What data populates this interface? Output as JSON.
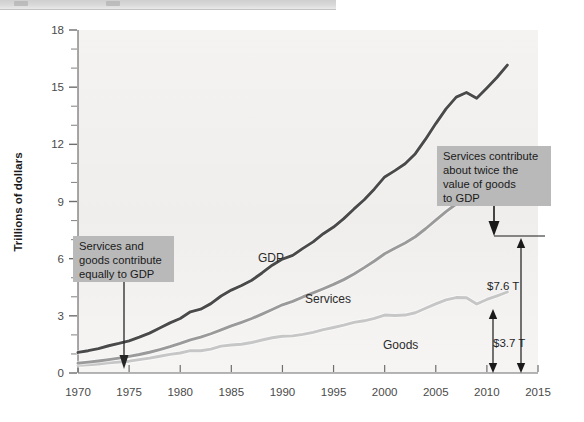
{
  "chrome": {
    "present": true
  },
  "chart_data": {
    "type": "line",
    "title": "",
    "xlabel": "",
    "ylabel": "Trillions of dollars",
    "xlim": [
      1970,
      2015
    ],
    "ylim": [
      0,
      18
    ],
    "xticks": [
      1970,
      1975,
      1980,
      1985,
      1990,
      1995,
      2000,
      2005,
      2010,
      2015
    ],
    "yticks": [
      0,
      3,
      6,
      9,
      12,
      15,
      18
    ],
    "y_minor_step": 1,
    "grid": false,
    "legend": "inline-series-labels",
    "colors": {
      "gdp": "#4a4a4a",
      "services": "#9a9a9a",
      "goods": "#c6c6c6",
      "plot_background": "#f2f1ef",
      "callout_background": "#b9b9b9",
      "axis": "#6e6e6e"
    },
    "x": [
      1970,
      1971,
      1972,
      1973,
      1974,
      1975,
      1976,
      1977,
      1978,
      1979,
      1980,
      1981,
      1982,
      1983,
      1984,
      1985,
      1986,
      1987,
      1988,
      1989,
      1990,
      1991,
      1992,
      1993,
      1994,
      1995,
      1996,
      1997,
      1998,
      1999,
      2000,
      2001,
      2002,
      2003,
      2004,
      2005,
      2006,
      2007,
      2008,
      2009,
      2010,
      2011,
      2012
    ],
    "series": [
      {
        "name": "GDP",
        "label": "GDP",
        "color": "#4a4a4a",
        "values": [
          1.08,
          1.17,
          1.28,
          1.43,
          1.55,
          1.69,
          1.88,
          2.09,
          2.36,
          2.63,
          2.86,
          3.21,
          3.35,
          3.64,
          4.04,
          4.35,
          4.59,
          4.87,
          5.25,
          5.66,
          5.98,
          6.17,
          6.54,
          6.88,
          7.31,
          7.66,
          8.1,
          8.61,
          9.09,
          9.66,
          10.29,
          10.62,
          10.98,
          11.51,
          12.27,
          13.09,
          13.86,
          14.48,
          14.72,
          14.42,
          14.96,
          15.52,
          16.16
        ],
        "end_value": 16.16
      },
      {
        "name": "Services",
        "label": "Services",
        "color": "#9a9a9a",
        "values": [
          0.52,
          0.57,
          0.63,
          0.7,
          0.78,
          0.87,
          0.97,
          1.09,
          1.23,
          1.38,
          1.55,
          1.74,
          1.88,
          2.06,
          2.26,
          2.47,
          2.66,
          2.86,
          3.09,
          3.33,
          3.58,
          3.76,
          3.99,
          4.2,
          4.42,
          4.65,
          4.9,
          5.2,
          5.53,
          5.88,
          6.26,
          6.55,
          6.82,
          7.15,
          7.57,
          8.02,
          8.47,
          8.87,
          9.07,
          9.0,
          9.25,
          9.6,
          10.0
        ],
        "end_value": 10.0
      },
      {
        "name": "Goods",
        "label": "Goods",
        "color": "#c6c6c6",
        "values": [
          0.4,
          0.43,
          0.47,
          0.54,
          0.58,
          0.62,
          0.7,
          0.78,
          0.88,
          0.98,
          1.05,
          1.17,
          1.17,
          1.25,
          1.41,
          1.47,
          1.51,
          1.6,
          1.73,
          1.85,
          1.93,
          1.95,
          2.03,
          2.13,
          2.28,
          2.39,
          2.51,
          2.66,
          2.74,
          2.87,
          3.04,
          3.02,
          3.04,
          3.16,
          3.4,
          3.63,
          3.84,
          3.96,
          3.95,
          3.62,
          3.86,
          4.05,
          4.25
        ],
        "end_value": 4.25
      }
    ],
    "annotations": [
      {
        "id": "callout-left",
        "text": "Services and goods contribute equally to GDP",
        "lines": [
          "Services and",
          "goods contribute",
          "equally to GDP"
        ],
        "points_to_year": 1975,
        "arrow": "down"
      },
      {
        "id": "callout-right",
        "text": "Services contribute about twice the value of goods to GDP",
        "lines": [
          "Services contribute",
          "about twice the",
          "value of goods",
          "to GDP"
        ],
        "points_to_year": 2012,
        "arrow": "down"
      }
    ],
    "measures": [
      {
        "id": "services-gap",
        "label": "$7.6 T",
        "from": 0,
        "to": 7.6,
        "at_year": 2014
      },
      {
        "id": "goods-gap",
        "label": "$3.7 T",
        "from": 0,
        "to": 3.7,
        "at_year": 2012
      }
    ]
  }
}
